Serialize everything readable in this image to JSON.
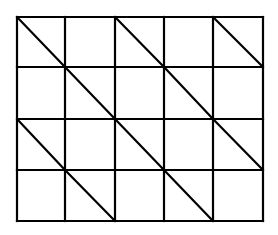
{
  "diagram": {
    "type": "grid-with-diagonals",
    "rows": 4,
    "cols": 5,
    "stroke_color": "#000000",
    "background_color": "#ffffff",
    "x_lines": [
      17,
      65,
      115,
      164,
      213,
      263
    ],
    "y_lines": [
      17,
      67,
      119,
      170,
      221
    ],
    "diagonals": [
      {
        "row": 0,
        "col": 0
      },
      {
        "row": 0,
        "col": 2
      },
      {
        "row": 0,
        "col": 4
      },
      {
        "row": 1,
        "col": 1
      },
      {
        "row": 1,
        "col": 3
      },
      {
        "row": 2,
        "col": 0
      },
      {
        "row": 2,
        "col": 2
      },
      {
        "row": 2,
        "col": 4
      },
      {
        "row": 3,
        "col": 1
      },
      {
        "row": 3,
        "col": 3
      }
    ],
    "diagonal_direction": "top-left-to-bottom-right"
  }
}
